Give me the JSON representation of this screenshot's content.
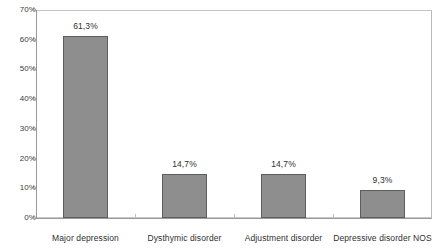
{
  "chart_data": {
    "type": "bar",
    "title": "",
    "xlabel": "",
    "ylabel": "",
    "categories": [
      "Major depression",
      "Dysthymic disorder",
      "Adjustment disorder",
      "Depressive disorder NOS"
    ],
    "values": [
      61.3,
      14.7,
      14.7,
      9.3
    ],
    "value_labels": [
      "61,3%",
      "14,7%",
      "14,7%",
      "9,3%"
    ],
    "ylim": [
      0,
      70
    ],
    "ytick_values": [
      0,
      10,
      20,
      30,
      40,
      50,
      60,
      70
    ],
    "ytick_labels": [
      "0%",
      "10%",
      "20%",
      "30%",
      "40%",
      "50%",
      "60%",
      "70%"
    ],
    "grid": false,
    "legend": null,
    "series": [
      {
        "name": "",
        "values": [
          61.3,
          14.7,
          14.7,
          9.3
        ]
      }
    ],
    "colors": {
      "bar_fill": "#8e8e8e",
      "bar_border": "#5d5d5d",
      "axis": "#9a9a9a",
      "plot_border": "#c9c9c9",
      "text": "#2f2f2f",
      "background": "#ffffff"
    }
  }
}
